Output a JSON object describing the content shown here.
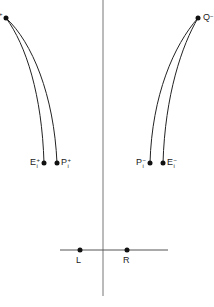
{
  "diagram": {
    "colors": {
      "line": "#222222",
      "axis": "#777777",
      "background": "#ffffff"
    },
    "axes": {
      "vertical": {
        "x": 103,
        "y1": 0,
        "y2": 296
      },
      "horizontal": {
        "y": 250,
        "x1": 60,
        "x2": 168
      }
    },
    "sources": [
      {
        "id": "Q_plus",
        "base": "",
        "sup": "+",
        "x": 6,
        "y": 18,
        "label_cut_off": true
      },
      {
        "id": "Q_minus",
        "base": "Q",
        "sup": "−",
        "x": 198,
        "y": 18
      }
    ],
    "endpoints": [
      {
        "id": "E_i_plus",
        "base": "E",
        "sup": "+",
        "sub": "i",
        "x": 44,
        "y": 163,
        "label_side": "left"
      },
      {
        "id": "P_i_plus",
        "base": "P",
        "sup": "+",
        "sub": "i",
        "x": 57,
        "y": 163,
        "label_side": "right"
      },
      {
        "id": "P_i_minus",
        "base": "P",
        "sup": "−",
        "sub": "i",
        "x": 150,
        "y": 163,
        "label_side": "left"
      },
      {
        "id": "E_i_minus",
        "base": "E",
        "sup": "−",
        "sub": "i",
        "x": 163,
        "y": 163,
        "label_side": "right"
      }
    ],
    "observers": [
      {
        "id": "L",
        "label": "L",
        "x": 80,
        "y": 250
      },
      {
        "id": "R",
        "label": "R",
        "x": 127,
        "y": 250
      }
    ]
  }
}
